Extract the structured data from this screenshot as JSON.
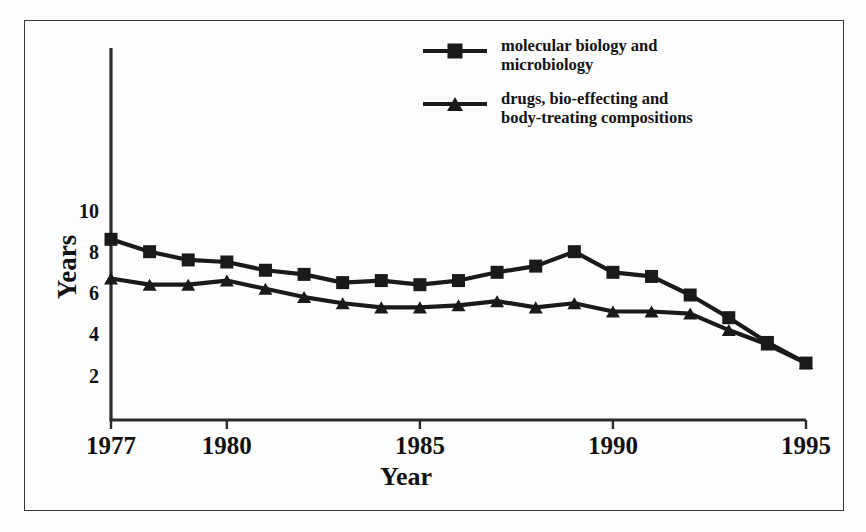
{
  "chart_data": {
    "type": "line",
    "title": "",
    "xlabel": "Year",
    "ylabel": "Years",
    "xlim": [
      1977,
      1995
    ],
    "ylim": [
      0,
      11
    ],
    "grid": false,
    "legend_position": "top-right",
    "xticks": [
      "1977",
      "1980",
      "1985",
      "1990",
      "1995"
    ],
    "xtick_values": [
      1977,
      1980,
      1985,
      1990,
      1995
    ],
    "yticks": [
      "2",
      "4",
      "6",
      "8",
      "10"
    ],
    "ytick_values": [
      2,
      4,
      6,
      8,
      10
    ],
    "x": [
      1977,
      1978,
      1979,
      1980,
      1981,
      1982,
      1983,
      1984,
      1985,
      1986,
      1987,
      1988,
      1989,
      1990,
      1991,
      1992,
      1993,
      1994,
      1995
    ],
    "series": [
      {
        "name": "molecular biology and\nmicrobiology",
        "legend_line1": "molecular biology and",
        "legend_line2": "microbiology",
        "marker": "square",
        "color": "#1a1a1a",
        "values": [
          8.7,
          8.1,
          7.7,
          7.6,
          7.2,
          7.0,
          6.6,
          6.7,
          6.5,
          6.7,
          7.1,
          7.4,
          8.1,
          7.1,
          6.9,
          6.0,
          4.9,
          3.7,
          2.7
        ]
      },
      {
        "name": "drugs, bio-effecting and\nbody-treating compositions",
        "legend_line1": "drugs, bio-effecting and",
        "legend_line2": "body-treating compositions",
        "marker": "triangle",
        "color": "#1a1a1a",
        "values": [
          6.8,
          6.5,
          6.5,
          6.7,
          6.3,
          5.9,
          5.6,
          5.4,
          5.4,
          5.5,
          5.7,
          5.4,
          5.6,
          5.2,
          5.2,
          5.1,
          4.3,
          3.6,
          2.7
        ]
      }
    ]
  },
  "axis": {
    "ylabel": "Years",
    "xlabel": "Year"
  }
}
